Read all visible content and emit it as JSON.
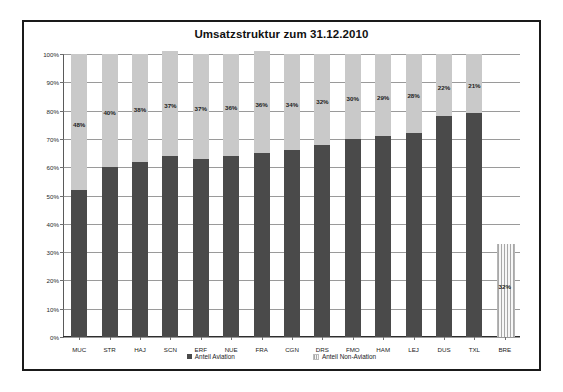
{
  "chart_data": {
    "type": "bar",
    "title": "Umsatzstruktur zum 31.12.2010",
    "xlabel": "",
    "ylabel": "",
    "ylim": [
      0,
      100
    ],
    "ytick_labels": [
      "0%",
      "10%",
      "20%",
      "30%",
      "40%",
      "50%",
      "60%",
      "70%",
      "80%",
      "90%",
      "100%"
    ],
    "grid": true,
    "stacked": true,
    "legend_position": "bottom",
    "categories": [
      "MUC",
      "STR",
      "HAJ",
      "SCN",
      "ERF",
      "NUE",
      "FRA",
      "CGN",
      "DRS",
      "FMO",
      "HAM",
      "LEJ",
      "DUS",
      "TXL",
      "BRE"
    ],
    "series": [
      {
        "name": "Anteil Aviation",
        "color": "#4a4a4a",
        "values": [
          52,
          60,
          62,
          64,
          63,
          64,
          65,
          66,
          68,
          70,
          71,
          72,
          78,
          79,
          null
        ]
      },
      {
        "name": "Anteil Non-Aviation",
        "color": "#c9c9c9",
        "values": [
          48,
          40,
          38,
          37,
          37,
          36,
          36,
          34,
          32,
          30,
          29,
          28,
          22,
          21,
          32
        ]
      }
    ],
    "data_labels": [
      "48%",
      "40%",
      "38%",
      "37%",
      "37%",
      "36%",
      "36%",
      "34%",
      "32%",
      "30%",
      "29%",
      "28%",
      "22%",
      "21%",
      "32%"
    ],
    "bre_note": "BRE shown as hatched pattern bar from 0% to 33%"
  },
  "legend": {
    "entries": [
      {
        "label": "Anteil Aviation",
        "style": "dark"
      },
      {
        "label": "Anteil Non-Aviation",
        "style": "light"
      }
    ]
  }
}
